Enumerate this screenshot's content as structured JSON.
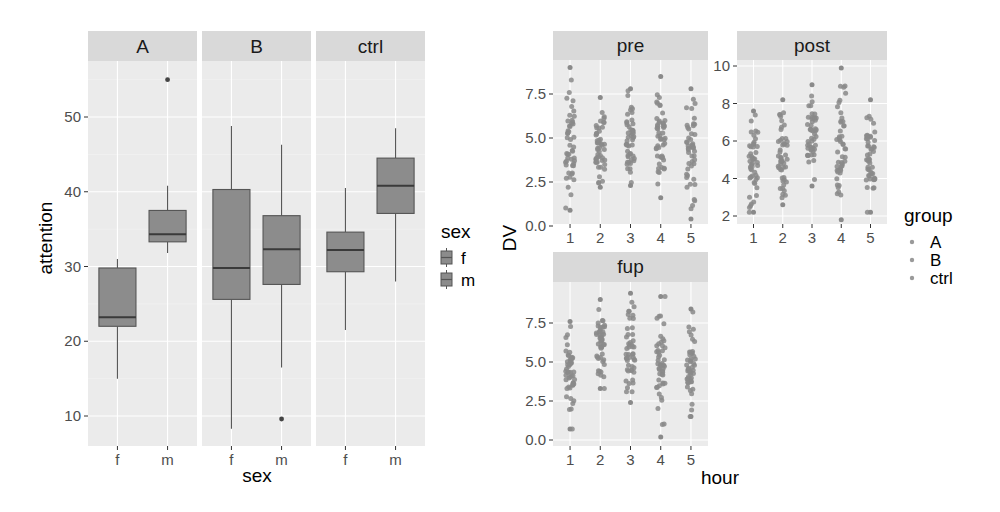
{
  "chart_data": [
    {
      "type": "box",
      "title": "",
      "xlabel": "sex",
      "ylabel": "attention",
      "facets": [
        "A",
        "B",
        "ctrl"
      ],
      "categories": [
        "f",
        "m"
      ],
      "yticks": [
        10,
        20,
        30,
        40,
        50
      ],
      "ylim": [
        6.5,
        57.5
      ],
      "grid": true,
      "legend": {
        "title": "sex",
        "entries": [
          "f",
          "m"
        ],
        "position": "right"
      },
      "boxes": [
        {
          "facet": "A",
          "sex": "f",
          "whisker_low": 15.0,
          "q1": 22.0,
          "median": 23.2,
          "q3": 29.8,
          "whisker_high": 31.0,
          "outliers": []
        },
        {
          "facet": "A",
          "sex": "m",
          "whisker_low": 31.8,
          "q1": 33.3,
          "median": 34.3,
          "q3": 37.5,
          "whisker_high": 40.8,
          "outliers": [
            55.0
          ]
        },
        {
          "facet": "B",
          "sex": "f",
          "whisker_low": 8.3,
          "q1": 25.6,
          "median": 29.8,
          "q3": 40.3,
          "whisker_high": 48.8,
          "outliers": []
        },
        {
          "facet": "B",
          "sex": "m",
          "whisker_low": 16.5,
          "q1": 27.6,
          "median": 32.3,
          "q3": 36.8,
          "whisker_high": 46.3,
          "outliers": [
            9.6
          ]
        },
        {
          "facet": "ctrl",
          "sex": "f",
          "whisker_low": 21.5,
          "q1": 29.3,
          "median": 32.2,
          "q3": 34.6,
          "whisker_high": 40.5,
          "outliers": []
        },
        {
          "facet": "ctrl",
          "sex": "m",
          "whisker_low": 28.0,
          "q1": 37.1,
          "median": 40.8,
          "q3": 44.5,
          "whisker_high": 48.5,
          "outliers": []
        }
      ]
    },
    {
      "type": "scatter",
      "title": "",
      "xlabel": "hour",
      "ylabel": "DV",
      "facets": [
        "pre",
        "post",
        "fup"
      ],
      "x": [
        1,
        2,
        3,
        4,
        5
      ],
      "grid": true,
      "legend": {
        "title": "group",
        "entries": [
          "A",
          "B",
          "ctrl"
        ],
        "position": "right"
      },
      "panels": [
        {
          "facet": "pre",
          "yticks": [
            0.0,
            2.5,
            5.0,
            7.5
          ],
          "ylim": [
            -0.3,
            9.8
          ],
          "ranges": [
            {
              "hour": 1,
              "min": 0.9,
              "max": 9.0
            },
            {
              "hour": 2,
              "min": 2.2,
              "max": 7.3
            },
            {
              "hour": 3,
              "min": 2.3,
              "max": 7.8
            },
            {
              "hour": 4,
              "min": 1.6,
              "max": 8.5
            },
            {
              "hour": 5,
              "min": 0.4,
              "max": 7.8
            }
          ]
        },
        {
          "facet": "post",
          "yticks": [
            2,
            4,
            6,
            8,
            10
          ],
          "ylim": [
            1.6,
            10.4
          ],
          "ranges": [
            {
              "hour": 1,
              "min": 2.2,
              "max": 7.6
            },
            {
              "hour": 2,
              "min": 2.6,
              "max": 8.2
            },
            {
              "hour": 3,
              "min": 3.6,
              "max": 9.0
            },
            {
              "hour": 4,
              "min": 1.8,
              "max": 9.9
            },
            {
              "hour": 5,
              "min": 2.2,
              "max": 8.2
            }
          ]
        },
        {
          "facet": "fup",
          "yticks": [
            0.0,
            2.5,
            5.0,
            7.5
          ],
          "ylim": [
            -0.3,
            9.8
          ],
          "ranges": [
            {
              "hour": 1,
              "min": 0.7,
              "max": 7.6
            },
            {
              "hour": 2,
              "min": 3.3,
              "max": 9.0
            },
            {
              "hour": 3,
              "min": 2.4,
              "max": 9.4
            },
            {
              "hour": 4,
              "min": 0.2,
              "max": 9.2
            },
            {
              "hour": 5,
              "min": 1.5,
              "max": 8.4
            }
          ]
        }
      ]
    }
  ],
  "colors": {
    "panel_bg": "#ebebeb",
    "strip_bg": "#d9d9d9",
    "grid": "#ffffff",
    "box_fill": "#8c8c8c",
    "box_line": "#555555",
    "point": "#8a8a8a",
    "tick_text": "#4d4d4d"
  },
  "left_chart": {
    "ylabel": "attention",
    "xlabel": "sex",
    "strips": [
      "A",
      "B",
      "ctrl"
    ],
    "xticks": [
      "f",
      "m"
    ],
    "yticks": [
      "10",
      "20",
      "30",
      "40",
      "50"
    ],
    "legend_title": "sex",
    "legend_items": [
      "f",
      "m"
    ]
  },
  "right_chart": {
    "ylabel": "DV",
    "xlabel": "hour",
    "strips": [
      "pre",
      "post",
      "fup"
    ],
    "xticks": [
      "1",
      "2",
      "3",
      "4",
      "5"
    ],
    "yticks_pre": [
      "0.0",
      "2.5",
      "5.0",
      "7.5"
    ],
    "yticks_post": [
      "2",
      "4",
      "6",
      "8",
      "10"
    ],
    "yticks_fup": [
      "0.0",
      "2.5",
      "5.0",
      "7.5"
    ],
    "legend_title": "group",
    "legend_items": [
      "A",
      "B",
      "ctrl"
    ]
  }
}
